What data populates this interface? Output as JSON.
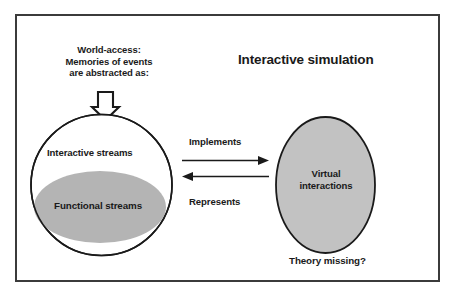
{
  "diagram": {
    "title": "Interactive simulation",
    "frame": {
      "border_color": "#3b3b3b",
      "background": "#ffffff"
    },
    "annotation": {
      "world_access": "World-access:\nMemories of events\nare abstracted as:",
      "down_arrow": "down-block-arrow"
    },
    "left_node": {
      "outer_label": "Interactive streams",
      "inner_label": "Functional streams",
      "outer_shape": "circle",
      "outer_fill": "#ffffff",
      "outer_stroke": "#1a1a1a",
      "inner_shape": "ellipse",
      "inner_fill": "#b4b4b4"
    },
    "right_node": {
      "label": "Virtual\ninteractions",
      "shape": "ellipse",
      "fill": "#c2c2c2",
      "stroke": "#1a1a1a"
    },
    "relations": [
      {
        "label": "Implements",
        "direction": "right",
        "from": "left_node",
        "to": "right_node"
      },
      {
        "label": "Represents",
        "direction": "left",
        "from": "right_node",
        "to": "left_node"
      }
    ],
    "footnote": "Theory missing?"
  }
}
